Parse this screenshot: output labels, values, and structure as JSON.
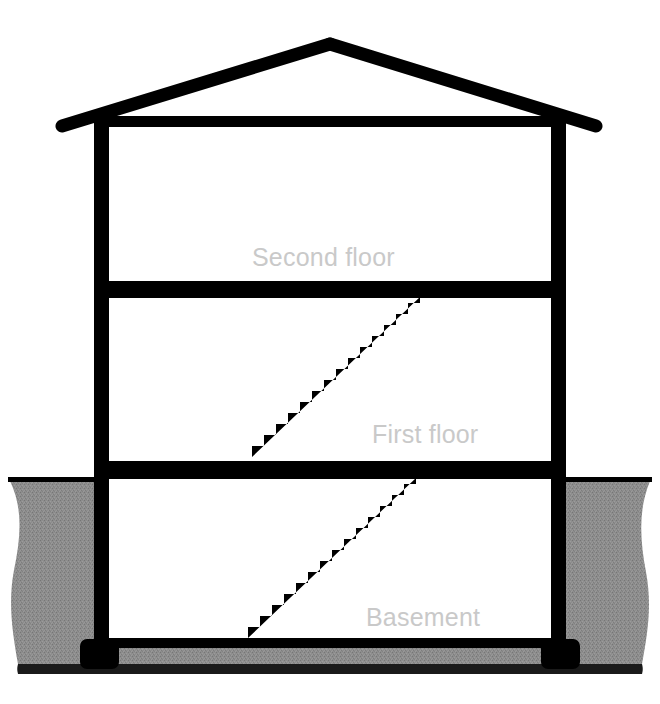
{
  "diagram": {
    "type": "architectural-section",
    "background_color": "#ffffff",
    "structure_color": "#000000",
    "soil_color": "#8a8a8a",
    "label_color": "#c9c9c9",
    "labels": {
      "second_floor": "Second floor",
      "first_floor": "First floor",
      "basement": "Basement"
    },
    "parts": {
      "roof": "roof-gable",
      "left_wall": "left-exterior-wall",
      "right_wall": "right-exterior-wall",
      "second_floor_slab": "second-floor-slab",
      "first_floor_slab": "first-floor-slab",
      "basement_slab": "basement-floor-slab",
      "left_footing": "left-footing",
      "right_footing": "right-footing",
      "upper_stair": "stair-first-to-second",
      "lower_stair": "stair-basement-to-first",
      "grade_line": "ground-grade-line",
      "soil": "soil-mass"
    },
    "levels": [
      {
        "name": "Second floor",
        "label_x": 252,
        "label_y": 266
      },
      {
        "name": "First floor",
        "label_x": 372,
        "label_y": 443
      },
      {
        "name": "Basement",
        "label_x": 366,
        "label_y": 626
      }
    ],
    "stairs": [
      {
        "name": "stair-first-to-second",
        "steps": 14,
        "start_x": 252,
        "start_y": 457,
        "end_x": 420,
        "end_y": 297
      },
      {
        "name": "stair-basement-to-first",
        "steps": 14,
        "start_x": 248,
        "start_y": 638,
        "end_x": 416,
        "end_y": 478
      }
    ]
  }
}
